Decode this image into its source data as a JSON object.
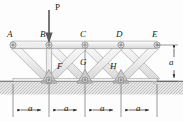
{
  "figure": {
    "type": "truss-structural-diagram",
    "colors": {
      "member_fill": "#f0f0f0",
      "member_stroke": "#8c8c8c",
      "pin_fill": "#b9b9b9",
      "pin_stroke": "#6e6e6e",
      "support_fill": "#c9c9c9",
      "ground_fill": "#e2e2e2",
      "ground_stroke": "#7a7a7a",
      "dimension_line": "#2b2b2b",
      "label_text": "#1a1a1a"
    },
    "load": {
      "label": "P",
      "direction": "down",
      "applied_at": "B"
    },
    "joint_labels": [
      {
        "name": "A",
        "text": "A",
        "x": 7,
        "y": 31
      },
      {
        "name": "B",
        "text": "B",
        "x": 42,
        "y": 31
      },
      {
        "name": "C",
        "text": "C",
        "x": 80,
        "y": 31
      },
      {
        "name": "D",
        "text": "D",
        "x": 116,
        "y": 31
      },
      {
        "name": "E",
        "text": "E",
        "x": 152,
        "y": 31
      },
      {
        "name": "F",
        "text": "F",
        "x": 58,
        "y": 64
      },
      {
        "name": "G",
        "text": "G",
        "x": 84,
        "y": 60
      },
      {
        "name": "H",
        "text": "H",
        "x": 112,
        "y": 64
      }
    ],
    "nodes": {
      "A": {
        "x": 13,
        "y": 45
      },
      "B": {
        "x": 49,
        "y": 45
      },
      "C": {
        "x": 85,
        "y": 45
      },
      "D": {
        "x": 121,
        "y": 45
      },
      "E": {
        "x": 157,
        "y": 45
      },
      "F": {
        "x": 49,
        "y": 81
      },
      "G": {
        "x": 85,
        "y": 81
      },
      "H": {
        "x": 121,
        "y": 81
      }
    },
    "members": [
      "A-B",
      "B-C",
      "C-D",
      "D-E",
      "A-F",
      "B-F",
      "F-G",
      "C-G",
      "B-G",
      "G-H",
      "C-H",
      "D-H",
      "D-G",
      "E-H"
    ],
    "supports": {
      "type": "pinned",
      "at": [
        "F",
        "G",
        "H"
      ]
    },
    "ground": {
      "y": 81,
      "hatched": true
    },
    "dimensions": {
      "horizontal": {
        "label": "a",
        "count": 4,
        "spans": [
          {
            "label": "a",
            "from_x": 13,
            "to_x": 49
          },
          {
            "label": "a",
            "from_x": 49,
            "to_x": 85
          },
          {
            "label": "a",
            "from_x": 85,
            "to_x": 121
          },
          {
            "label": "a",
            "from_x": 121,
            "to_x": 157
          }
        ],
        "line_y": 110
      },
      "vertical": {
        "label": "a",
        "from_y": 45,
        "to_y": 81,
        "line_x": 174
      }
    }
  }
}
